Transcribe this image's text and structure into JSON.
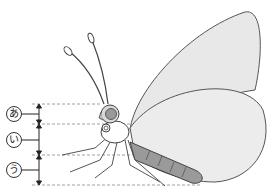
{
  "labels": [
    {
      "id": "a",
      "text": "あ",
      "part": "head"
    },
    {
      "id": "i",
      "text": "い",
      "part": "thorax"
    },
    {
      "id": "u",
      "text": "う",
      "part": "abdomen"
    }
  ],
  "colors": {
    "wing": "#e8e8e8",
    "body": "#9a9a9a",
    "outline": "#555555",
    "guide": "#888888"
  }
}
